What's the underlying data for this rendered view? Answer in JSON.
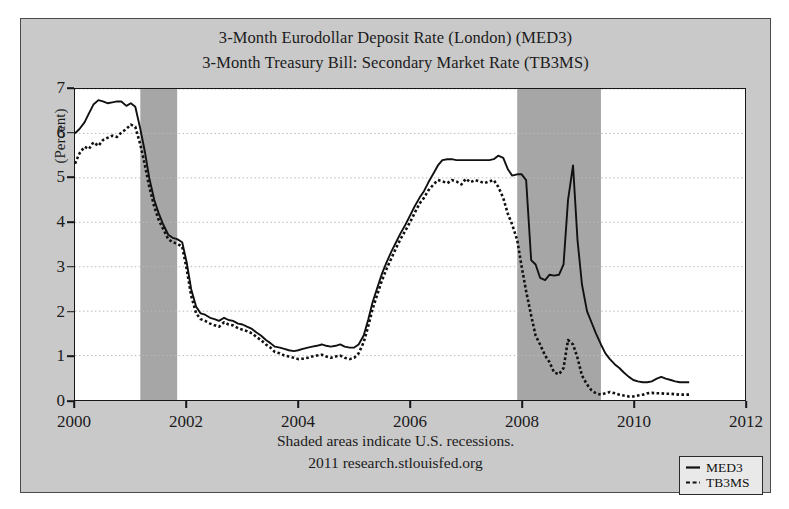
{
  "figure": {
    "title_line1": "3-Month Eurodollar Deposit Rate (London) (MED3)",
    "title_line2": "3-Month Treasury Bill: Secondary Market Rate (TB3MS)",
    "footnote1": "Shaded areas indicate U.S. recessions.",
    "footnote2": "2011 research.stlouisfed.org",
    "background_color": "#c9c9c9",
    "plot_background_color": "#ffffff",
    "recession_shade_color": "#a6a6a6"
  },
  "legend": {
    "entries": [
      {
        "label": "MED3",
        "style": "solid",
        "color": "#111111"
      },
      {
        "label": "TB3MS",
        "style": "dashed",
        "color": "#111111"
      }
    ]
  },
  "axes": {
    "ylabel": "(Percent)",
    "yticks": [
      0,
      1,
      2,
      3,
      4,
      5,
      6,
      7
    ],
    "xticks": [
      2000,
      2002,
      2004,
      2006,
      2008,
      2010,
      2012
    ]
  },
  "chart_data": {
    "type": "line",
    "xlabel": "",
    "ylabel": "(Percent)",
    "xlim": [
      2000.0,
      2012.0
    ],
    "ylim": [
      0,
      7
    ],
    "grid": true,
    "legend_position": "bottom-right",
    "annotations": [
      "Shaded areas indicate U.S. recessions.",
      "2011 research.stlouisfed.org"
    ],
    "shaded_regions": [
      {
        "label": "2001 recession",
        "x0": 2001.17,
        "x1": 2001.83
      },
      {
        "label": "2007-2009 recession",
        "x0": 2007.92,
        "x1": 2009.42
      }
    ],
    "series": [
      {
        "name": "MED3",
        "style": "solid",
        "x": [
          2000.0,
          2000.08,
          2000.17,
          2000.25,
          2000.33,
          2000.42,
          2000.5,
          2000.58,
          2000.67,
          2000.75,
          2000.83,
          2000.92,
          2001.0,
          2001.08,
          2001.17,
          2001.25,
          2001.33,
          2001.42,
          2001.5,
          2001.58,
          2001.67,
          2001.75,
          2001.83,
          2001.92,
          2002.0,
          2002.08,
          2002.17,
          2002.25,
          2002.33,
          2002.42,
          2002.5,
          2002.58,
          2002.67,
          2002.75,
          2002.83,
          2002.92,
          2003.0,
          2003.08,
          2003.17,
          2003.25,
          2003.33,
          2003.42,
          2003.5,
          2003.58,
          2003.67,
          2003.75,
          2003.83,
          2003.92,
          2004.0,
          2004.08,
          2004.17,
          2004.25,
          2004.33,
          2004.42,
          2004.5,
          2004.58,
          2004.67,
          2004.75,
          2004.83,
          2004.92,
          2005.0,
          2005.08,
          2005.17,
          2005.25,
          2005.33,
          2005.42,
          2005.5,
          2005.58,
          2005.67,
          2005.75,
          2005.83,
          2005.92,
          2006.0,
          2006.08,
          2006.17,
          2006.25,
          2006.33,
          2006.42,
          2006.5,
          2006.58,
          2006.67,
          2006.75,
          2006.83,
          2006.92,
          2007.0,
          2007.08,
          2007.17,
          2007.25,
          2007.33,
          2007.42,
          2007.5,
          2007.58,
          2007.67,
          2007.75,
          2007.83,
          2007.92,
          2008.0,
          2008.08,
          2008.17,
          2008.25,
          2008.33,
          2008.42,
          2008.5,
          2008.58,
          2008.67,
          2008.75,
          2008.83,
          2008.92,
          2009.0,
          2009.08,
          2009.17,
          2009.25,
          2009.33,
          2009.42,
          2009.5,
          2009.58,
          2009.67,
          2009.75,
          2009.83,
          2009.92,
          2010.0,
          2010.08,
          2010.17,
          2010.25,
          2010.33,
          2010.42,
          2010.5,
          2010.58,
          2010.67,
          2010.75,
          2010.83,
          2010.92,
          2011.0
        ],
        "y": [
          6.0,
          6.1,
          6.25,
          6.45,
          6.65,
          6.75,
          6.72,
          6.68,
          6.7,
          6.72,
          6.72,
          6.62,
          6.68,
          6.6,
          6.1,
          5.6,
          5.0,
          4.5,
          4.2,
          3.95,
          3.72,
          3.65,
          3.62,
          3.55,
          3.1,
          2.5,
          2.1,
          1.95,
          1.92,
          1.85,
          1.82,
          1.78,
          1.85,
          1.8,
          1.78,
          1.72,
          1.7,
          1.65,
          1.6,
          1.52,
          1.45,
          1.35,
          1.28,
          1.2,
          1.18,
          1.15,
          1.12,
          1.1,
          1.12,
          1.15,
          1.18,
          1.2,
          1.22,
          1.25,
          1.22,
          1.2,
          1.22,
          1.25,
          1.2,
          1.18,
          1.18,
          1.25,
          1.45,
          1.8,
          2.2,
          2.55,
          2.85,
          3.1,
          3.35,
          3.55,
          3.75,
          3.95,
          4.15,
          4.35,
          4.55,
          4.7,
          4.9,
          5.1,
          5.28,
          5.4,
          5.42,
          5.42,
          5.4,
          5.4,
          5.4,
          5.4,
          5.4,
          5.4,
          5.4,
          5.4,
          5.42,
          5.5,
          5.45,
          5.2,
          5.05,
          5.08,
          5.08,
          4.95,
          3.15,
          3.05,
          2.75,
          2.7,
          2.82,
          2.8,
          2.82,
          3.05,
          4.5,
          5.28,
          3.6,
          2.6,
          2.0,
          1.75,
          1.5,
          1.25,
          1.05,
          0.92,
          0.8,
          0.72,
          0.62,
          0.52,
          0.45,
          0.42,
          0.4,
          0.4,
          0.42,
          0.48,
          0.52,
          0.48,
          0.45,
          0.42,
          0.4,
          0.4,
          0.4
        ]
      },
      {
        "name": "TB3MS",
        "style": "dashed",
        "x": [
          2000.0,
          2000.08,
          2000.17,
          2000.25,
          2000.33,
          2000.42,
          2000.5,
          2000.58,
          2000.67,
          2000.75,
          2000.83,
          2000.92,
          2001.0,
          2001.08,
          2001.17,
          2001.25,
          2001.33,
          2001.42,
          2001.5,
          2001.58,
          2001.67,
          2001.75,
          2001.83,
          2001.92,
          2002.0,
          2002.08,
          2002.17,
          2002.25,
          2002.33,
          2002.42,
          2002.5,
          2002.58,
          2002.67,
          2002.75,
          2002.83,
          2002.92,
          2003.0,
          2003.08,
          2003.17,
          2003.25,
          2003.33,
          2003.42,
          2003.5,
          2003.58,
          2003.67,
          2003.75,
          2003.83,
          2003.92,
          2004.0,
          2004.08,
          2004.17,
          2004.25,
          2004.33,
          2004.42,
          2004.5,
          2004.58,
          2004.67,
          2004.75,
          2004.83,
          2004.92,
          2005.0,
          2005.08,
          2005.17,
          2005.25,
          2005.33,
          2005.42,
          2005.5,
          2005.58,
          2005.67,
          2005.75,
          2005.83,
          2005.92,
          2006.0,
          2006.08,
          2006.17,
          2006.25,
          2006.33,
          2006.42,
          2006.5,
          2006.58,
          2006.67,
          2006.75,
          2006.83,
          2006.92,
          2007.0,
          2007.08,
          2007.17,
          2007.25,
          2007.33,
          2007.42,
          2007.5,
          2007.58,
          2007.67,
          2007.75,
          2007.83,
          2007.92,
          2008.0,
          2008.08,
          2008.17,
          2008.25,
          2008.33,
          2008.42,
          2008.5,
          2008.58,
          2008.67,
          2008.75,
          2008.83,
          2008.92,
          2009.0,
          2009.08,
          2009.17,
          2009.25,
          2009.33,
          2009.42,
          2009.5,
          2009.58,
          2009.67,
          2009.75,
          2009.83,
          2009.92,
          2010.0,
          2010.08,
          2010.17,
          2010.25,
          2010.33,
          2010.42,
          2010.5,
          2010.58,
          2010.67,
          2010.75,
          2010.83,
          2010.92,
          2011.0
        ],
        "y": [
          5.32,
          5.55,
          5.7,
          5.65,
          5.8,
          5.72,
          5.85,
          5.9,
          5.95,
          5.92,
          6.02,
          6.1,
          6.2,
          6.15,
          5.75,
          5.3,
          4.8,
          4.35,
          4.05,
          3.85,
          3.62,
          3.55,
          3.52,
          3.45,
          2.95,
          2.35,
          1.95,
          1.82,
          1.78,
          1.72,
          1.68,
          1.65,
          1.75,
          1.7,
          1.68,
          1.62,
          1.58,
          1.55,
          1.5,
          1.42,
          1.35,
          1.25,
          1.18,
          1.08,
          1.05,
          1.0,
          0.98,
          0.95,
          0.92,
          0.93,
          0.95,
          0.98,
          1.0,
          1.02,
          0.98,
          0.95,
          0.98,
          1.0,
          0.95,
          0.92,
          0.95,
          1.05,
          1.3,
          1.65,
          2.05,
          2.4,
          2.7,
          2.95,
          3.2,
          3.42,
          3.62,
          3.82,
          4.0,
          4.2,
          4.42,
          4.55,
          4.72,
          4.85,
          4.95,
          4.92,
          4.88,
          4.95,
          4.92,
          4.85,
          4.98,
          4.9,
          4.95,
          4.92,
          4.88,
          4.92,
          4.95,
          4.8,
          4.55,
          4.2,
          3.95,
          3.6,
          3.0,
          2.45,
          1.9,
          1.45,
          1.25,
          1.0,
          0.85,
          0.62,
          0.58,
          0.72,
          1.35,
          1.25,
          0.95,
          0.55,
          0.35,
          0.22,
          0.15,
          0.12,
          0.15,
          0.18,
          0.15,
          0.12,
          0.1,
          0.08,
          0.08,
          0.1,
          0.12,
          0.15,
          0.16,
          0.15,
          0.15,
          0.14,
          0.14,
          0.13,
          0.12,
          0.12,
          0.12
        ]
      }
    ]
  }
}
